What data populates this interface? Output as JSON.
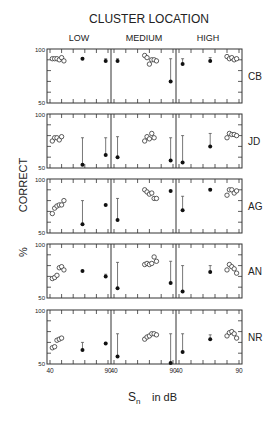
{
  "chart_data": {
    "type": "scatter",
    "title": "CLUSTER LOCATION",
    "xlabel": "Sn in dB",
    "xlabel_main": "S",
    "xlabel_sub": "n",
    "xlabel_rest": "in dB",
    "ylabel": "% CORRECT",
    "ylabel_pct": "%",
    "ylabel_word": "CORRECT",
    "ylim": [
      50,
      100
    ],
    "xlim": [
      40,
      90
    ],
    "y_ticks": [
      "100",
      "50"
    ],
    "x_ticks": [
      "40",
      "90"
    ],
    "columns": [
      "LOW",
      "MEDIUM",
      "HIGH"
    ],
    "rows": [
      "CB",
      "JD",
      "AG",
      "AN",
      "NR"
    ],
    "grid": false,
    "legend": null,
    "panels": [
      {
        "subject": "CB",
        "col": "LOW",
        "open": [
          [
            42,
            91
          ],
          [
            44,
            91
          ],
          [
            46,
            91
          ],
          [
            48,
            90
          ],
          [
            50,
            92
          ],
          [
            52,
            89
          ]
        ],
        "filled": [
          [
            68,
            91,
            92,
            90
          ],
          [
            88,
            89,
            91,
            88
          ]
        ]
      },
      {
        "subject": "CB",
        "col": "MEDIUM",
        "open": [
          [
            66,
            94
          ],
          [
            68,
            92
          ],
          [
            70,
            86
          ],
          [
            72,
            90
          ],
          [
            74,
            90
          ],
          [
            76,
            89
          ]
        ],
        "filled": [
          [
            43,
            89,
            91,
            88
          ],
          [
            88,
            70,
            91,
            70
          ]
        ]
      },
      {
        "subject": "CB",
        "col": "HIGH",
        "open": [
          [
            80,
            93
          ],
          [
            82,
            91
          ],
          [
            84,
            92
          ],
          [
            86,
            90
          ],
          [
            88,
            91
          ]
        ],
        "filled": [
          [
            43,
            86,
            91,
            86
          ],
          [
            66,
            89,
            92,
            89
          ]
        ]
      },
      {
        "subject": "JD",
        "col": "LOW",
        "open": [
          [
            42,
            75
          ],
          [
            44,
            78
          ],
          [
            46,
            78
          ],
          [
            48,
            76
          ],
          [
            50,
            79
          ]
        ],
        "filled": [
          [
            68,
            53,
            78,
            53
          ],
          [
            88,
            62,
            78,
            62
          ]
        ]
      },
      {
        "subject": "JD",
        "col": "MEDIUM",
        "open": [
          [
            66,
            75
          ],
          [
            68,
            79
          ],
          [
            70,
            77
          ],
          [
            72,
            82
          ],
          [
            74,
            78
          ]
        ],
        "filled": [
          [
            43,
            60,
            79,
            60
          ],
          [
            88,
            57,
            78,
            57
          ]
        ]
      },
      {
        "subject": "JD",
        "col": "HIGH",
        "open": [
          [
            80,
            78
          ],
          [
            82,
            82
          ],
          [
            84,
            81
          ],
          [
            86,
            81
          ],
          [
            88,
            80
          ]
        ],
        "filled": [
          [
            43,
            55,
            80,
            55
          ],
          [
            66,
            70,
            82,
            70
          ]
        ]
      },
      {
        "subject": "AG",
        "col": "LOW",
        "open": [
          [
            42,
            68
          ],
          [
            44,
            73
          ],
          [
            46,
            75
          ],
          [
            48,
            76
          ],
          [
            50,
            76
          ],
          [
            52,
            80
          ]
        ],
        "filled": [
          [
            68,
            58,
            80,
            58
          ],
          [
            88,
            76,
            76,
            76
          ]
        ]
      },
      {
        "subject": "AG",
        "col": "MEDIUM",
        "open": [
          [
            66,
            90
          ],
          [
            68,
            88
          ],
          [
            70,
            86
          ],
          [
            72,
            87
          ],
          [
            74,
            82
          ],
          [
            76,
            82
          ]
        ],
        "filled": [
          [
            43,
            62,
            82,
            62
          ],
          [
            88,
            89,
            89,
            89
          ]
        ]
      },
      {
        "subject": "AG",
        "col": "HIGH",
        "open": [
          [
            80,
            85
          ],
          [
            82,
            90
          ],
          [
            84,
            90
          ],
          [
            86,
            87
          ],
          [
            88,
            89
          ]
        ],
        "filled": [
          [
            43,
            71,
            84,
            71
          ],
          [
            66,
            90,
            91,
            90
          ]
        ]
      },
      {
        "subject": "AN",
        "col": "LOW",
        "open": [
          [
            42,
            68
          ],
          [
            44,
            69
          ],
          [
            46,
            71
          ],
          [
            48,
            78
          ],
          [
            50,
            79
          ],
          [
            52,
            76
          ]
        ],
        "filled": [
          [
            68,
            75,
            75,
            75
          ],
          [
            88,
            70,
            72,
            70
          ]
        ]
      },
      {
        "subject": "AN",
        "col": "MEDIUM",
        "open": [
          [
            66,
            81
          ],
          [
            68,
            82
          ],
          [
            70,
            81
          ],
          [
            72,
            82
          ],
          [
            74,
            88
          ],
          [
            76,
            84
          ]
        ],
        "filled": [
          [
            43,
            59,
            83,
            59
          ],
          [
            88,
            64,
            84,
            64
          ]
        ]
      },
      {
        "subject": "AN",
        "col": "HIGH",
        "open": [
          [
            80,
            76
          ],
          [
            82,
            81
          ],
          [
            84,
            79
          ],
          [
            86,
            77
          ],
          [
            88,
            73
          ]
        ],
        "filled": [
          [
            43,
            56,
            80,
            56
          ],
          [
            66,
            74,
            80,
            74
          ]
        ]
      },
      {
        "subject": "NR",
        "col": "LOW",
        "open": [
          [
            42,
            65
          ],
          [
            44,
            66
          ],
          [
            46,
            72
          ],
          [
            48,
            73
          ],
          [
            50,
            74
          ]
        ],
        "filled": [
          [
            68,
            63,
            70,
            63
          ],
          [
            88,
            69,
            70,
            69
          ]
        ]
      },
      {
        "subject": "NR",
        "col": "MEDIUM",
        "open": [
          [
            66,
            73
          ],
          [
            68,
            75
          ],
          [
            70,
            76
          ],
          [
            72,
            78
          ],
          [
            74,
            78
          ],
          [
            76,
            77
          ]
        ],
        "filled": [
          [
            43,
            57,
            78,
            57
          ],
          [
            88,
            51,
            78,
            51
          ]
        ]
      },
      {
        "subject": "NR",
        "col": "HIGH",
        "open": [
          [
            80,
            76
          ],
          [
            82,
            79
          ],
          [
            84,
            80
          ],
          [
            86,
            78
          ],
          [
            88,
            74
          ]
        ],
        "filled": [
          [
            43,
            61,
            78,
            61
          ],
          [
            66,
            73,
            77,
            73
          ]
        ]
      }
    ]
  }
}
